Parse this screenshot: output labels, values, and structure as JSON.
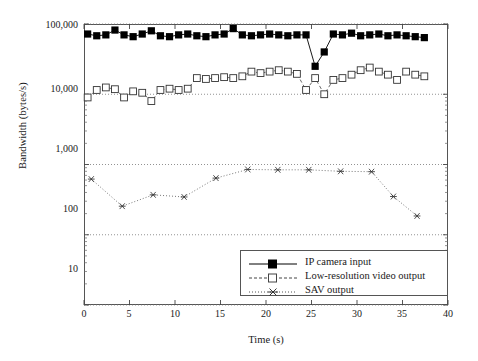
{
  "chart_data": {
    "type": "line",
    "title": "",
    "xlabel": "Time (s)",
    "ylabel": "Bandwidth (bytes/s)",
    "xlim": [
      0,
      40
    ],
    "ylim": [
      10,
      100000
    ],
    "yscale": "log",
    "grid": true,
    "legend_position": "bottom-right",
    "xticks": [
      0,
      5,
      10,
      15,
      20,
      25,
      30,
      35,
      40
    ],
    "xtick_labels": [
      "0",
      "5",
      "10",
      "15",
      "20",
      "25",
      "30",
      "35",
      "40"
    ],
    "yticks": [
      10,
      100,
      1000,
      10000,
      100000
    ],
    "ytick_labels": [
      "10",
      "100",
      "1,000",
      "10,000",
      "100,000"
    ],
    "series": [
      {
        "name": "IP camera input",
        "marker": "filled-square",
        "line": "solid",
        "color": "#000000",
        "x": [
          0.4,
          1.4,
          2.4,
          3.4,
          4.4,
          5.4,
          6.4,
          7.4,
          8.4,
          9.4,
          10.4,
          11.4,
          12.4,
          13.4,
          14.4,
          15.4,
          16.4,
          17.4,
          18.4,
          19.4,
          20.4,
          21.4,
          22.4,
          23.4,
          24.4,
          25.4,
          26.4,
          27.4,
          28.4,
          29.4,
          30.4,
          31.4,
          32.4,
          33.4,
          34.4,
          35.4,
          36.4,
          37.4
        ],
        "y": [
          72000,
          68000,
          70000,
          82000,
          70000,
          66000,
          72000,
          80000,
          68000,
          66000,
          70000,
          72000,
          68000,
          66000,
          70000,
          72000,
          86000,
          70000,
          68000,
          70000,
          72000,
          70000,
          68000,
          70000,
          70000,
          25000,
          40000,
          72000,
          70000,
          74000,
          68000,
          70000,
          72000,
          68000,
          70000,
          68000,
          66000,
          64000
        ]
      },
      {
        "name": "Low-resolution video output",
        "marker": "open-square",
        "line": "dashed",
        "color": "#444444",
        "x": [
          0.4,
          1.4,
          2.4,
          3.4,
          4.4,
          5.4,
          6.4,
          7.4,
          8.4,
          9.4,
          10.4,
          11.4,
          12.4,
          13.4,
          14.4,
          15.4,
          16.4,
          17.4,
          18.4,
          19.4,
          20.4,
          21.4,
          22.4,
          23.4,
          24.4,
          25.4,
          26.4,
          27.4,
          28.4,
          29.4,
          30.4,
          31.4,
          32.4,
          33.4,
          34.4,
          35.4,
          36.4,
          37.4
        ],
        "y": [
          9000,
          11500,
          12500,
          11800,
          9000,
          11000,
          10500,
          8000,
          11500,
          12000,
          11500,
          12000,
          17000,
          16500,
          17000,
          17500,
          17000,
          18000,
          21000,
          20000,
          21000,
          22000,
          21000,
          19500,
          11500,
          17000,
          10000,
          16000,
          17000,
          19000,
          22000,
          24000,
          21000,
          19000,
          16000,
          21000,
          19000,
          18000
        ]
      },
      {
        "name": "SAV output",
        "marker": "asterisk",
        "line": "dotted",
        "color": "#555555",
        "x": [
          0.8,
          4.2,
          7.6,
          11.0,
          14.5,
          18.0,
          21.3,
          24.7,
          28.2,
          31.6,
          34.0,
          36.6
        ],
        "y": [
          620,
          255,
          370,
          345,
          640,
          850,
          840,
          840,
          800,
          790,
          350,
          185
        ]
      }
    ]
  },
  "legend": {
    "items": [
      {
        "label": "IP camera input"
      },
      {
        "label": "Low-resolution video output"
      },
      {
        "label": "SAV output"
      }
    ]
  }
}
